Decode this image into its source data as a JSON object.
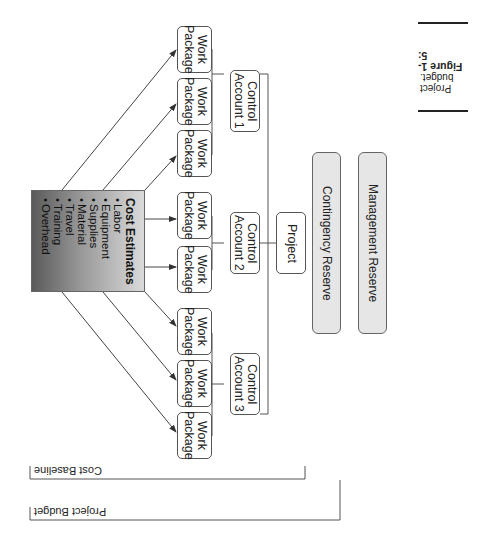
{
  "figure": {
    "number_label": "Figure 1-5:",
    "caption": "Project budget."
  },
  "diagram": {
    "root": "Project",
    "control_accounts": [
      {
        "label_line1": "Control",
        "label_line2": "Account 1",
        "work_packages": [
          "Work Package",
          "Work Package",
          "Work Package"
        ]
      },
      {
        "label_line1": "Control",
        "label_line2": "Account 2",
        "work_packages": [
          "Work Package",
          "Work Package"
        ]
      },
      {
        "label_line1": "Control",
        "label_line2": "Account 3",
        "work_packages": [
          "Work Package",
          "Work Package",
          "Work Package"
        ]
      }
    ],
    "work_package_line1": "Work",
    "work_package_line2": "Package",
    "reserves": [
      "Contingency Reserve",
      "Management Reserve"
    ],
    "cost_estimates": {
      "title": "Cost Estimates",
      "items": [
        "Labor",
        "Equipment",
        "Supplies",
        "Material",
        "Travel",
        "Training",
        "Overhead"
      ]
    },
    "brackets": [
      "Cost Baseline",
      "Project Budget"
    ]
  },
  "colors": {
    "line": "#444444",
    "reserve_fill": "#e6e6e6",
    "gradient_dark": "#5a5a5a",
    "gradient_light": "#dadada"
  }
}
